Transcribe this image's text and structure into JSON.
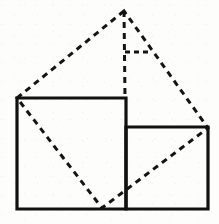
{
  "figure": {
    "kind": "geometry-diagram",
    "canvas": {
      "width": 219,
      "height": 224
    },
    "colors": {
      "background": "#fdfdfc",
      "solid_stroke": "#111111",
      "dashed_stroke": "#141414"
    },
    "strokes": {
      "solid_width": 3.2,
      "dashed_width": 3.0,
      "dash_pattern": "6 5"
    },
    "points": {
      "apex": {
        "x": 124,
        "y": 11,
        "label": "apex"
      },
      "large_top_left": {
        "x": 17,
        "y": 98,
        "label": "large-square-top-left"
      },
      "large_top_right": {
        "x": 126,
        "y": 98,
        "label": "large-square-top-right"
      },
      "large_bottom_left": {
        "x": 17,
        "y": 209,
        "label": "large-square-bottom-left"
      },
      "large_bottom_right": {
        "x": 126,
        "y": 209,
        "label": "large-square-bottom-right"
      },
      "small_top_left": {
        "x": 126,
        "y": 127,
        "label": "small-square-top-left"
      },
      "small_top_right": {
        "x": 208,
        "y": 127,
        "label": "small-square-top-right"
      },
      "small_bottom_left": {
        "x": 126,
        "y": 209,
        "label": "small-square-bottom-left"
      },
      "small_bottom_right": {
        "x": 208,
        "y": 209,
        "label": "small-square-bottom-right"
      },
      "bottom_vertex": {
        "x": 102,
        "y": 208,
        "label": "dashed-quad-bottom-vertex"
      },
      "right_angle_corner": {
        "x": 125,
        "y": 52,
        "label": "right-angle-corner"
      },
      "right_angle_end": {
        "x": 148,
        "y": 52,
        "label": "right-angle-tick-end"
      }
    },
    "shapes": {
      "large_square": {
        "name": "large-square",
        "path": "M 17 98 L 126 98 L 126 209 L 17 209 Z",
        "style": "solid"
      },
      "small_square": {
        "name": "small-square",
        "path": "M 126 127 L 208 127 L 208 209 L 126 209 Z",
        "style": "solid"
      },
      "dashed_quadrilateral": {
        "name": "dashed-quadrilateral",
        "path": "M 124 11 L 17 98 L 102 208 L 208 128 Z",
        "style": "dashed"
      },
      "dashed_altitude": {
        "name": "dashed-altitude",
        "path": "M 124 11 L 125 98",
        "style": "dashed"
      },
      "right_angle_tick": {
        "name": "right-angle-tick",
        "path": "M 125 52 L 148 52",
        "style": "dashed"
      }
    }
  }
}
